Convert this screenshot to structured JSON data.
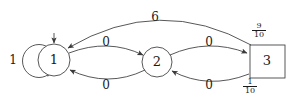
{
  "figure": {
    "type": "state-transition-diagram",
    "background_color": "#ffffff",
    "stroke_color": "#3a3a3a",
    "text_color": "#1a1a1a"
  },
  "nodes": [
    {
      "id": "1",
      "label": "1",
      "shape": "circle",
      "cx": 54,
      "cy": 60,
      "r": 16
    },
    {
      "id": "2",
      "label": "2",
      "shape": "circle",
      "cx": 157,
      "cy": 62,
      "r": 15
    },
    {
      "id": "3",
      "label": "3",
      "shape": "square",
      "x": 250,
      "y": 45,
      "w": 35,
      "h": 33
    }
  ],
  "edges": [
    {
      "name": "self-loop-1",
      "from": "1",
      "to": "1",
      "label": "1"
    },
    {
      "name": "edge-1-to-2",
      "from": "1",
      "to": "2",
      "label": "0"
    },
    {
      "name": "edge-2-to-1",
      "from": "2",
      "to": "1",
      "label": "0"
    },
    {
      "name": "edge-2-to-3",
      "from": "2",
      "to": "3",
      "label": "0"
    },
    {
      "name": "edge-3-to-2",
      "from": "3",
      "to": "2",
      "label": "0"
    },
    {
      "name": "edge-3-to-1-arc",
      "from": "3",
      "to": "1",
      "label": "6"
    }
  ],
  "labels": {
    "self_loop_weight": "1",
    "top_arc_weight": "6",
    "edge_1_2_top": "0",
    "edge_2_1_bottom": "0",
    "edge_2_3_top": "0",
    "edge_3_2_bottom": "0",
    "node_1": "1",
    "node_2": "2",
    "node_3": "3"
  },
  "fractions": {
    "upper": {
      "numerator": "9",
      "denominator": "10"
    },
    "lower": {
      "numerator": "1",
      "denominator": "10"
    }
  }
}
